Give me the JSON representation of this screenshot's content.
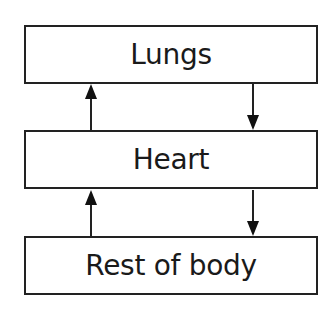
{
  "diagram": {
    "title": "",
    "nodes": [
      {
        "id": "lungs",
        "label": "Lungs"
      },
      {
        "id": "heart",
        "label": "Heart"
      },
      {
        "id": "rest_of_body",
        "label": "Rest of body"
      }
    ],
    "edges": [
      {
        "from": "heart",
        "to": "lungs",
        "direction": "up",
        "position": "left"
      },
      {
        "from": "lungs",
        "to": "heart",
        "direction": "down",
        "position": "right"
      },
      {
        "from": "rest_of_body",
        "to": "heart",
        "direction": "up",
        "position": "left"
      },
      {
        "from": "heart",
        "to": "rest_of_body",
        "direction": "down",
        "position": "right"
      }
    ],
    "colors": {
      "stroke": "#222222",
      "text": "#1a1a1a",
      "background": "#ffffff"
    }
  }
}
